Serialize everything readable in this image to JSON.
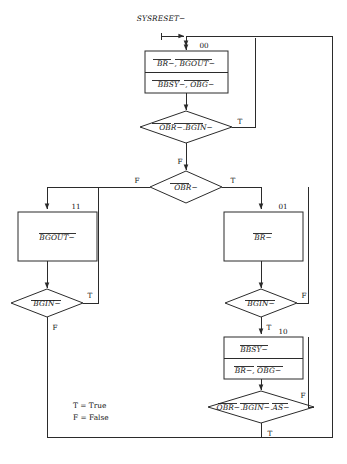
{
  "diagram": {
    "type": "flowchart",
    "title_label": "SYSRESET−",
    "legend": {
      "true_line": "T = True",
      "false_line": "F = False"
    },
    "states": {
      "s00": "00",
      "s01": "01",
      "s10": "10",
      "s11": "11"
    },
    "boxes": {
      "box_00_line1": "BR−, BGOUT−",
      "box_00_line2": "BBSY−, OBG−",
      "box_11": "BGOUT−",
      "box_01": "BR−",
      "box_10_line1": "BBSY−",
      "box_10_line2": "BR−, OBG−"
    },
    "decisions": {
      "d1": "OBR−.BGIN−",
      "d2": "OBR−",
      "d3": "BGIN−",
      "d4": "BGIN−",
      "d5": "OBR−.BGIN−.AS−"
    },
    "edge_labels": {
      "d1_true": "T",
      "d1_false": "F",
      "d2_true": "T",
      "d2_false": "F",
      "d3_true": "T",
      "d3_false": "F",
      "d4_true": "T",
      "d4_false": "F",
      "d5_true": "T",
      "d5_false": "F"
    },
    "colors": {
      "stroke": "#2b2b2b",
      "text": "#111111",
      "background": "#ffffff"
    }
  }
}
